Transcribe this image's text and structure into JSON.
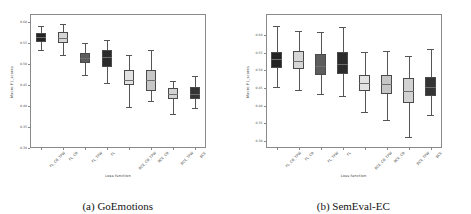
{
  "figure": {
    "panels": [
      {
        "caption": "(a) GoEmotions",
        "xlabel": "Loss function",
        "ylabel": "Macro F1_scores"
      },
      {
        "caption": "(b) SemEval-EC",
        "xlabel": "Loss function",
        "ylabel": "Macro F1_scores"
      }
    ]
  },
  "chart_data": [
    {
      "type": "box",
      "title": "(a) GoEmotions",
      "xlabel": "Loss function",
      "ylabel": "Macro F1_scores",
      "categories": [
        "FL_CB_TPW",
        "FL_CB",
        "FL_TPW",
        "FL",
        "BCE_CB_TPW",
        "BCE_CB",
        "BCE_TPW",
        "BCE"
      ],
      "ylim": [
        0.3,
        0.62
      ],
      "yticks": [
        0.3,
        0.35,
        0.4,
        0.45,
        0.5,
        0.55,
        0.6
      ],
      "ytick_labels": [
        "0.30",
        "0.35",
        "0.40",
        "0.45",
        "0.50",
        "0.55",
        "0.60"
      ],
      "grid": false,
      "legend": "none",
      "boxes": [
        {
          "category": "FL_CB_TPW",
          "whisker_low": 0.535,
          "q1": 0.552,
          "median": 0.566,
          "q3": 0.575,
          "whisker_high": 0.592,
          "fill": "#232323"
        },
        {
          "category": "FL_CB",
          "whisker_low": 0.522,
          "q1": 0.551,
          "median": 0.562,
          "q3": 0.578,
          "whisker_high": 0.596,
          "fill": "#d6d6d6"
        },
        {
          "category": "FL_TPW",
          "whisker_low": 0.474,
          "q1": 0.504,
          "median": 0.515,
          "q3": 0.528,
          "whisker_high": 0.551,
          "fill": "#5d5d5d"
        },
        {
          "category": "FL",
          "whisker_low": 0.456,
          "q1": 0.494,
          "median": 0.518,
          "q3": 0.534,
          "whisker_high": 0.558,
          "fill": "#2b2b2b"
        },
        {
          "category": "BCE_CB_TPW",
          "whisker_low": 0.398,
          "q1": 0.45,
          "median": 0.462,
          "q3": 0.487,
          "whisker_high": 0.522,
          "fill": "#e2e2e2"
        },
        {
          "category": "BCE_CB",
          "whisker_low": 0.413,
          "q1": 0.436,
          "median": 0.462,
          "q3": 0.486,
          "whisker_high": 0.534,
          "fill": "#c6c6c6"
        },
        {
          "category": "BCE_TPW",
          "whisker_low": 0.381,
          "q1": 0.418,
          "median": 0.428,
          "q3": 0.443,
          "whisker_high": 0.46,
          "fill": "#d2d2d2"
        },
        {
          "category": "BCE",
          "whisker_low": 0.396,
          "q1": 0.418,
          "median": 0.43,
          "q3": 0.446,
          "whisker_high": 0.473,
          "fill": "#343434"
        }
      ]
    },
    {
      "type": "box",
      "title": "(b) SemEval-EC",
      "xlabel": "Loss function",
      "ylabel": "Macro F1_scores",
      "categories": [
        "FL_CB_TPW",
        "FL_CB",
        "FL_TPW",
        "FL",
        "BCE_CB_TPW",
        "BCE_CB",
        "BCE_TPW",
        "BCE"
      ],
      "ylim": [
        0.28,
        0.66
      ],
      "yticks": [
        0.3,
        0.35,
        0.4,
        0.45,
        0.5,
        0.55,
        0.6
      ],
      "ytick_labels": [
        "0.30",
        "0.35",
        "0.40",
        "0.45",
        "0.50",
        "0.55",
        "0.60"
      ],
      "grid": false,
      "legend": "none",
      "boxes": [
        {
          "category": "FL_CB_TPW",
          "whisker_low": 0.452,
          "q1": 0.508,
          "median": 0.531,
          "q3": 0.553,
          "whisker_high": 0.626,
          "fill": "#232323"
        },
        {
          "category": "FL_CB",
          "whisker_low": 0.444,
          "q1": 0.503,
          "median": 0.528,
          "q3": 0.556,
          "whisker_high": 0.612,
          "fill": "#d6d6d6"
        },
        {
          "category": "FL_TPW",
          "whisker_low": 0.432,
          "q1": 0.487,
          "median": 0.512,
          "q3": 0.546,
          "whisker_high": 0.61,
          "fill": "#5d5d5d"
        },
        {
          "category": "FL",
          "whisker_low": 0.428,
          "q1": 0.489,
          "median": 0.518,
          "q3": 0.551,
          "whisker_high": 0.622,
          "fill": "#2b2b2b"
        },
        {
          "category": "BCE_CB_TPW",
          "whisker_low": 0.382,
          "q1": 0.442,
          "median": 0.464,
          "q3": 0.487,
          "whisker_high": 0.551,
          "fill": "#e2e2e2"
        },
        {
          "category": "BCE_CB",
          "whisker_low": 0.358,
          "q1": 0.432,
          "median": 0.461,
          "q3": 0.488,
          "whisker_high": 0.556,
          "fill": "#c6c6c6"
        },
        {
          "category": "BCE_TPW",
          "whisker_low": 0.312,
          "q1": 0.408,
          "median": 0.441,
          "q3": 0.478,
          "whisker_high": 0.542,
          "fill": "#d2d2d2"
        },
        {
          "category": "BCE",
          "whisker_low": 0.374,
          "q1": 0.427,
          "median": 0.452,
          "q3": 0.481,
          "whisker_high": 0.562,
          "fill": "#343434"
        }
      ]
    }
  ]
}
